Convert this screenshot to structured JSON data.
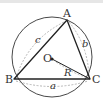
{
  "diagram": {
    "vertices": {
      "A": {
        "label": "A",
        "x": 67,
        "y": 20
      },
      "B": {
        "label": "B",
        "x": 14,
        "y": 79
      },
      "C": {
        "label": "C",
        "x": 90,
        "y": 79
      }
    },
    "center": {
      "label": "O",
      "x": 52,
      "y": 59
    },
    "circle": {
      "cx": 52,
      "cy": 57,
      "r": 40
    },
    "sides": {
      "a": {
        "label": "a",
        "between": "B-C"
      },
      "b": {
        "label": "b",
        "between": "A-C"
      },
      "c": {
        "label": "c",
        "between": "A-B"
      }
    },
    "radius": {
      "label": "R",
      "from": "O",
      "to": "C"
    },
    "colors": {
      "stroke": "#222222",
      "dashed": "#999999",
      "label": "#333333"
    }
  }
}
